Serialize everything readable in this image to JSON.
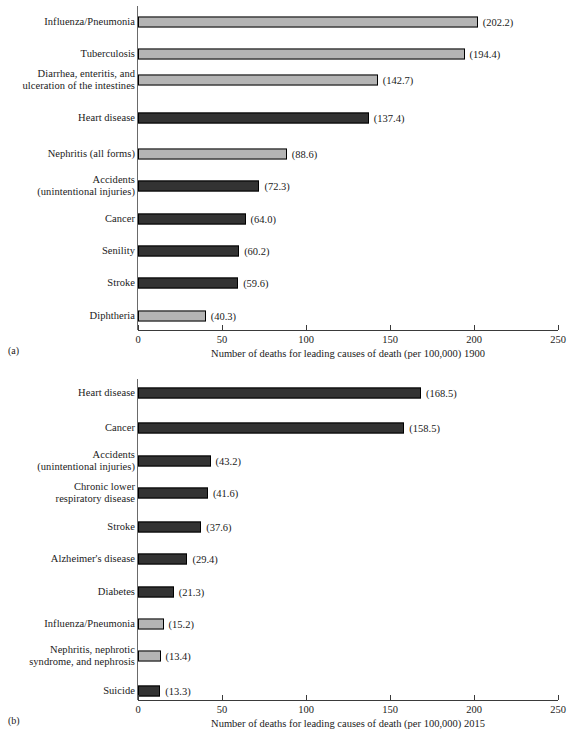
{
  "figure": {
    "axis": {
      "min": 0,
      "max": 250,
      "ticks": [
        0,
        50,
        100,
        150,
        200,
        250
      ],
      "tick_labels": [
        "0",
        "50",
        "100",
        "150",
        "200",
        "250"
      ]
    },
    "colors": {
      "light_bar": "#b4b4b4",
      "dark_bar": "#333333",
      "bar_outline": "#000000",
      "axis": "#3a3a3a"
    }
  },
  "panel_a": {
    "panel_label": "(a)",
    "axis_title": "Number of deaths for leading causes of death (per 100,000) 1900"
  },
  "panel_b": {
    "panel_label": "(b)",
    "axis_title": "Number of deaths for leading causes of death (per 100,000) 2015"
  },
  "chart_data": [
    {
      "type": "bar",
      "orientation": "horizontal",
      "panel": "(a)",
      "title": "",
      "xlabel": "Number of deaths for leading causes of death (per 100,000) 1900",
      "ylabel": "",
      "xlim": [
        0,
        250
      ],
      "xticks": [
        0,
        50,
        100,
        150,
        200,
        250
      ],
      "grid": false,
      "legend": false,
      "categories": [
        "Influenza/Pneumonia",
        "Tuberculosis",
        "Diarrhea, enteritis, and\nulceration of the intestines",
        "Heart disease",
        "Nephritis (all forms)",
        "Accidents\n(unintentional injuries)",
        "Cancer",
        "Senility",
        "Stroke",
        "Diphtheria"
      ],
      "values": [
        202.2,
        194.4,
        142.7,
        137.4,
        88.6,
        72.3,
        64.0,
        60.2,
        59.6,
        40.3
      ],
      "data_labels": [
        "(202.2)",
        "(194.4)",
        "(142.7)",
        "(137.4)",
        "(88.6)",
        "(72.3)",
        "(64.0)",
        "(60.2)",
        "(59.6)",
        "(40.3)"
      ],
      "bar_shades": [
        "light",
        "light",
        "light",
        "dark",
        "light",
        "dark",
        "dark",
        "dark",
        "dark",
        "light"
      ]
    },
    {
      "type": "bar",
      "orientation": "horizontal",
      "panel": "(b)",
      "title": "",
      "xlabel": "Number of deaths for leading causes of death (per 100,000) 2015",
      "ylabel": "",
      "xlim": [
        0,
        250
      ],
      "xticks": [
        0,
        50,
        100,
        150,
        200,
        250
      ],
      "grid": false,
      "legend": false,
      "categories": [
        "Heart disease",
        "Cancer",
        "Accidents\n(unintentional injuries)",
        "Chronic lower\nrespiratory disease",
        "Stroke",
        "Alzheimer's disease",
        "Diabetes",
        "Influenza/Pneumonia",
        "Nephritis, nephrotic\nsyndrome, and nephrosis",
        "Suicide"
      ],
      "values": [
        168.5,
        158.5,
        43.2,
        41.6,
        37.6,
        29.4,
        21.3,
        15.2,
        13.4,
        13.3
      ],
      "data_labels": [
        "(168.5)",
        "(158.5)",
        "(43.2)",
        "(41.6)",
        "(37.6)",
        "(29.4)",
        "(21.3)",
        "(15.2)",
        "(13.4)",
        "(13.3)"
      ],
      "bar_shades": [
        "dark",
        "dark",
        "dark",
        "dark",
        "dark",
        "dark",
        "dark",
        "light",
        "light",
        "dark"
      ]
    }
  ]
}
